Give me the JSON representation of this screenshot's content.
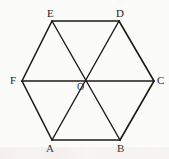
{
  "figure": {
    "background_color": "#fbfbfa",
    "stroke_color": "#1b1b1b",
    "label_color": "#1b1b1b",
    "width": 169,
    "height": 159,
    "vertices": [
      {
        "id": "A",
        "label": "A",
        "x": 52,
        "y": 140,
        "label_x": 46,
        "label_y": 143
      },
      {
        "id": "B",
        "label": "B",
        "x": 120,
        "y": 140,
        "label_x": 117,
        "label_y": 143
      },
      {
        "id": "C",
        "label": "C",
        "x": 154,
        "y": 81,
        "label_x": 157,
        "label_y": 75
      },
      {
        "id": "D",
        "label": "D",
        "x": 119,
        "y": 21,
        "label_x": 116,
        "label_y": 8
      },
      {
        "id": "E",
        "label": "E",
        "x": 52,
        "y": 21,
        "label_x": 47,
        "label_y": 8
      },
      {
        "id": "F",
        "label": "F",
        "x": 22,
        "y": 81,
        "label_x": 10,
        "label_y": 75
      }
    ],
    "center": {
      "id": "O",
      "label": "O",
      "x": 87,
      "y": 81,
      "label_x": 77,
      "label_y": 82
    },
    "edges": [
      {
        "from": "A",
        "to": "B"
      },
      {
        "from": "B",
        "to": "C"
      },
      {
        "from": "C",
        "to": "D"
      },
      {
        "from": "D",
        "to": "E"
      },
      {
        "from": "E",
        "to": "F"
      },
      {
        "from": "F",
        "to": "A"
      }
    ],
    "diagonals": [
      {
        "from": "F",
        "to": "C"
      },
      {
        "from": "A",
        "to": "D"
      },
      {
        "from": "B",
        "to": "E"
      }
    ]
  }
}
